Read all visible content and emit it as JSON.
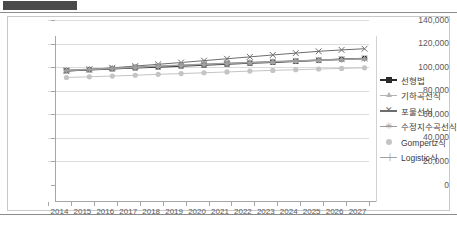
{
  "header": {
    "redaction_label": ""
  },
  "chart_data": {
    "type": "line",
    "title": "",
    "xlabel": "",
    "ylabel": "",
    "ylim": [
      0,
      140000
    ],
    "ytick_values": [
      0,
      20000,
      40000,
      60000,
      80000,
      100000,
      120000,
      140000
    ],
    "ytick_labels": [
      "0",
      "20,000",
      "40,000",
      "60,000",
      "80,000",
      "100,000",
      "120,000",
      "140,000"
    ],
    "grid": true,
    "legend_position": "right",
    "categories": [
      "2014",
      "2015",
      "2016",
      "2017",
      "2018",
      "2019",
      "2020",
      "2021",
      "2022",
      "2023",
      "2024",
      "2025",
      "2026",
      "2027"
    ],
    "series": [
      {
        "name": "선형법",
        "marker": "square",
        "color": "#2b2b2b",
        "values": [
          110600,
          111400,
          112200,
          113000,
          113800,
          114600,
          115400,
          116200,
          117000,
          117800,
          118600,
          119400,
          120200,
          121000
        ]
      },
      {
        "name": "기하곡선식",
        "marker": "triangle",
        "color": "#b3b3b3",
        "values": [
          110900,
          111700,
          112600,
          113500,
          114400,
          115200,
          116000,
          116800,
          117500,
          118200,
          118900,
          119500,
          120100,
          120700
        ]
      },
      {
        "name": "포물선식",
        "marker": "cross",
        "color": "#6d6d6d",
        "values": [
          110200,
          111600,
          113000,
          114500,
          116000,
          117500,
          119100,
          120700,
          122300,
          123900,
          125500,
          127000,
          128200,
          129200
        ]
      },
      {
        "name": "수정지수곡선식",
        "marker": "star",
        "color": "#9c9c9c",
        "values": [
          111100,
          111900,
          112800,
          113700,
          114600,
          115400,
          116200,
          117000,
          117700,
          118400,
          119000,
          119600,
          120200,
          120800
        ]
      },
      {
        "name": "Gompertz식",
        "marker": "dot",
        "color": "#c4c4c4",
        "values": [
          104800,
          105400,
          106000,
          106700,
          107500,
          108100,
          108800,
          109500,
          110200,
          110800,
          111400,
          112000,
          112500,
          113000
        ]
      },
      {
        "name": "Logistic식",
        "marker": "plus",
        "color": "#a0a0a0",
        "values": [
          110700,
          111500,
          112400,
          113300,
          114200,
          115000,
          115800,
          116600,
          117300,
          118000,
          118700,
          119300,
          119900,
          120500
        ]
      }
    ]
  }
}
